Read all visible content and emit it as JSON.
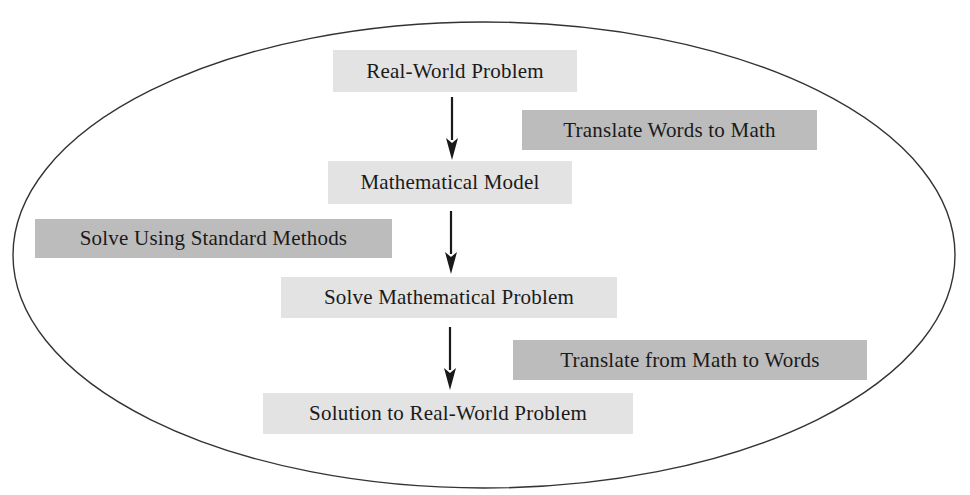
{
  "diagram": {
    "type": "flowchart",
    "container_shape": "ellipse",
    "colors": {
      "background": "#ffffff",
      "ellipse_stroke": "#333333",
      "step_box_fill": "#e3e3e3",
      "action_box_fill": "#bcbcbc",
      "text": "#1a1a1a",
      "arrow": "#1a1a1a"
    },
    "steps": [
      {
        "id": "real-world-problem",
        "label": "Real-World Problem"
      },
      {
        "id": "mathematical-model",
        "label": "Mathematical Model"
      },
      {
        "id": "solve-mathematical-problem",
        "label": "Solve Mathematical Problem"
      },
      {
        "id": "solution-to-real-world-problem",
        "label": "Solution to Real-World Problem"
      }
    ],
    "actions": [
      {
        "id": "translate-words-to-math",
        "label": "Translate Words to Math",
        "between": [
          "real-world-problem",
          "mathematical-model"
        ],
        "side": "right"
      },
      {
        "id": "solve-using-standard-methods",
        "label": "Solve Using Standard Methods",
        "between": [
          "mathematical-model",
          "solve-mathematical-problem"
        ],
        "side": "left"
      },
      {
        "id": "translate-from-math-to-words",
        "label": "Translate from Math to Words",
        "between": [
          "solve-mathematical-problem",
          "solution-to-real-world-problem"
        ],
        "side": "right"
      }
    ],
    "arrows": [
      {
        "from": "real-world-problem",
        "to": "mathematical-model",
        "direction": "down"
      },
      {
        "from": "mathematical-model",
        "to": "solve-mathematical-problem",
        "direction": "down"
      },
      {
        "from": "solve-mathematical-problem",
        "to": "solution-to-real-world-problem",
        "direction": "down"
      }
    ]
  }
}
